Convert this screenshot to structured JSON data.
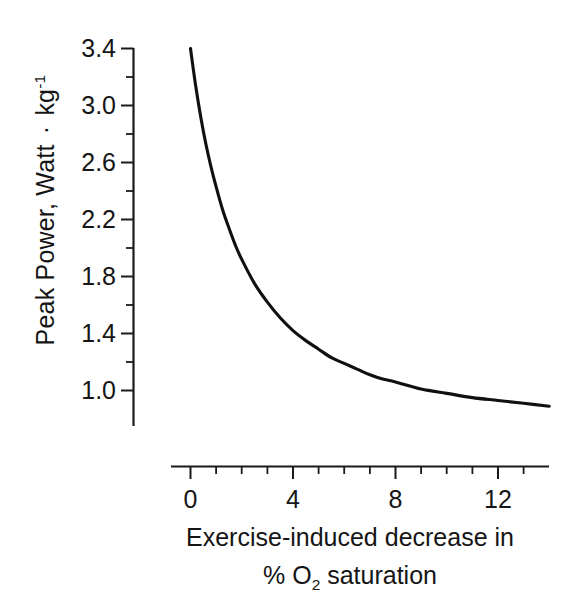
{
  "chart_data": {
    "type": "line",
    "title": "",
    "subtitle": "",
    "xlabel_line1": "Exercise-induced decrease in",
    "xlabel_line2_prefix": "% O",
    "xlabel_line2_sub": "2",
    "xlabel_line2_suffix": " saturation",
    "ylabel_prefix": "Peak Power, Watt ",
    "ylabel_midot": "·",
    "ylabel_unit": " kg",
    "ylabel_exponent": "-1",
    "xlim": [
      -0.7,
      14.0
    ],
    "ylim": [
      0.72,
      3.52
    ],
    "xticks": [
      0,
      4,
      8,
      12
    ],
    "xtick_labels": [
      "0",
      "4",
      "8",
      "12"
    ],
    "xticks_minor": [
      1,
      2,
      3,
      5,
      6,
      7,
      9,
      10,
      11,
      13
    ],
    "yticks": [
      3.4,
      3.0,
      2.6,
      2.2,
      1.8,
      1.4,
      1.0
    ],
    "ytick_labels": [
      "3.4",
      "3.0",
      "2.6",
      "2.2",
      "1.8",
      "1.4",
      "1.0"
    ],
    "yticks_minor": [
      3.2,
      2.8,
      2.4,
      2.0,
      1.6,
      1.2
    ],
    "grid": false,
    "legend": false,
    "legend_position": "none",
    "line_color": "#101010",
    "series": [
      {
        "name": "Peak Power vs exercise-induced desaturation",
        "x": [
          0.0,
          0.2,
          0.4,
          0.6,
          0.8,
          1.0,
          1.25,
          1.5,
          1.75,
          2.0,
          2.5,
          3.0,
          3.5,
          4.0,
          4.5,
          5.0,
          5.5,
          6.0,
          6.5,
          7.0,
          7.5,
          8.0,
          9.0,
          10.0,
          11.0,
          12.0,
          13.0,
          14.0
        ],
        "y": [
          3.4,
          3.14,
          2.92,
          2.73,
          2.57,
          2.43,
          2.27,
          2.14,
          2.02,
          1.92,
          1.75,
          1.62,
          1.51,
          1.42,
          1.35,
          1.29,
          1.23,
          1.19,
          1.15,
          1.11,
          1.08,
          1.06,
          1.01,
          0.98,
          0.95,
          0.93,
          0.91,
          0.89
        ]
      }
    ],
    "annotations": []
  },
  "axes": {
    "y_axis_name": "peak-power-axis",
    "x_axis_name": "desaturation-axis"
  }
}
